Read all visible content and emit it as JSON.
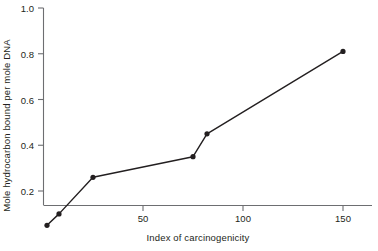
{
  "chart_data": {
    "type": "line",
    "title": "",
    "xlabel": "Index of carcinogenicity",
    "ylabel": "Mole hydrocarbon bound per mole DNA",
    "xlim": [
      0,
      160
    ],
    "ylim": [
      0,
      1.0
    ],
    "grid": false,
    "legend": null,
    "marker": "filled-circle",
    "line_color": "#231f20",
    "marker_color": "#231f20",
    "xticks": [
      50,
      100,
      150
    ],
    "xtick_labels": [
      "50",
      "100",
      "150"
    ],
    "yticks": [
      0.2,
      0.4,
      0.6,
      0.8,
      1.0
    ],
    "ytick_labels": [
      "0.2",
      "0.4",
      "0.6",
      "0.8",
      "1.0"
    ],
    "series": [
      {
        "name": "hydrocarbon binding",
        "x": [
          2,
          8,
          25,
          75,
          82,
          150
        ],
        "y": [
          0.05,
          0.1,
          0.26,
          0.35,
          0.45,
          0.81
        ]
      }
    ]
  },
  "axes": {
    "x_title": "Index of carcinogenicity",
    "y_title": "Mole hydrocarbon bound per mole DNA"
  },
  "ticks": {
    "y": [
      "1.0",
      "0.8",
      "0.6",
      "0.4",
      "0.2"
    ],
    "x": [
      "50",
      "100",
      "150"
    ]
  }
}
